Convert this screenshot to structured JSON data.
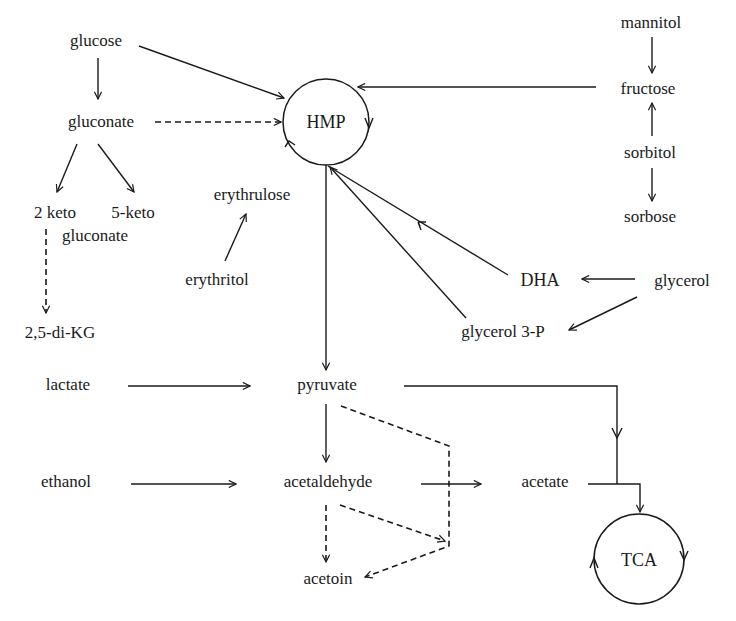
{
  "diagram": {
    "type": "metabolic pathway diagram",
    "cycles": {
      "hmp": "HMP",
      "tca": "TCA"
    },
    "nodes": {
      "glucose": "glucose",
      "gluconate": "gluconate",
      "keto2": "2 keto",
      "keto5": "5-keto",
      "keto_gluconate": "gluconate",
      "dikg": "2,5-di-KG",
      "erythrulose": "erythrulose",
      "erythritol": "erythritol",
      "mannitol": "mannitol",
      "fructose": "fructose",
      "sorbitol": "sorbitol",
      "sorbose": "sorbose",
      "dha": "DHA",
      "glycerol": "glycerol",
      "glycerol3p": "glycerol 3-P",
      "lactate": "lactate",
      "pyruvate": "pyruvate",
      "ethanol": "ethanol",
      "acetaldehyde": "acetaldehyde",
      "acetate": "acetate",
      "acetoin": "acetoin"
    },
    "edges": [
      {
        "from": "glucose",
        "to": "HMP",
        "style": "solid"
      },
      {
        "from": "glucose",
        "to": "gluconate",
        "style": "solid"
      },
      {
        "from": "gluconate",
        "to": "HMP",
        "style": "dashed"
      },
      {
        "from": "gluconate",
        "to": "2 keto gluconate",
        "style": "solid"
      },
      {
        "from": "gluconate",
        "to": "5-keto gluconate",
        "style": "solid"
      },
      {
        "from": "2 keto gluconate",
        "to": "2,5-di-KG",
        "style": "dashed"
      },
      {
        "from": "erythritol",
        "to": "erythrulose",
        "style": "solid"
      },
      {
        "from": "mannitol",
        "to": "fructose",
        "style": "solid"
      },
      {
        "from": "sorbitol",
        "to": "fructose",
        "style": "solid"
      },
      {
        "from": "sorbitol",
        "to": "sorbose",
        "style": "solid"
      },
      {
        "from": "fructose",
        "to": "HMP",
        "style": "solid"
      },
      {
        "from": "glycerol",
        "to": "DHA",
        "style": "solid"
      },
      {
        "from": "glycerol",
        "to": "glycerol 3-P",
        "style": "solid"
      },
      {
        "from": "DHA",
        "to": "HMP",
        "style": "solid"
      },
      {
        "from": "glycerol 3-P",
        "to": "HMP",
        "style": "solid"
      },
      {
        "from": "HMP",
        "to": "pyruvate",
        "style": "solid"
      },
      {
        "from": "lactate",
        "to": "pyruvate",
        "style": "solid"
      },
      {
        "from": "pyruvate",
        "to": "acetaldehyde",
        "style": "solid"
      },
      {
        "from": "pyruvate",
        "to": "acetoin",
        "style": "dashed"
      },
      {
        "from": "pyruvate",
        "to": "TCA",
        "style": "solid"
      },
      {
        "from": "ethanol",
        "to": "acetaldehyde",
        "style": "solid"
      },
      {
        "from": "acetaldehyde",
        "to": "acetate",
        "style": "solid"
      },
      {
        "from": "acetaldehyde",
        "to": "acetoin",
        "style": "dashed"
      },
      {
        "from": "acetate",
        "to": "TCA",
        "style": "solid"
      }
    ]
  }
}
